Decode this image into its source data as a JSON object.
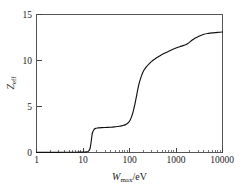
{
  "chart_data": {
    "type": "line",
    "title": "",
    "subtitle": "",
    "xlabel": "W_max/eV",
    "xlabel_parts": {
      "symbol": "W",
      "subscript": "max",
      "unit": "/eV"
    },
    "ylabel": "Z_eff",
    "ylabel_parts": {
      "symbol": "Z",
      "subscript": "eff"
    },
    "xscale": "log",
    "yscale": "linear",
    "xlim": [
      1,
      10000
    ],
    "ylim": [
      0,
      15
    ],
    "grid": false,
    "legend": false,
    "legend_position": "none",
    "xticks": [
      1,
      10,
      100,
      1000,
      10000
    ],
    "xtick_labels": [
      "1",
      "10",
      "100",
      "1000",
      "10000"
    ],
    "yticks": [
      0,
      5,
      10,
      15
    ],
    "ytick_labels": [
      "0",
      "5",
      "10",
      "15"
    ],
    "minor_ticks": "log decades 2-9",
    "curve_color": "#111111",
    "series": [
      {
        "name": "Z_eff",
        "x": [
          1,
          2,
          3,
          5,
          7,
          9,
          11,
          12,
          13,
          14,
          14.5,
          15,
          15.5,
          16,
          17,
          18,
          19,
          20,
          22,
          25,
          30,
          40,
          50,
          60,
          70,
          80,
          90,
          100,
          110,
          120,
          130,
          140,
          150,
          160,
          180,
          200,
          230,
          260,
          300,
          350,
          400,
          500,
          600,
          700,
          800,
          1000,
          1200,
          1500,
          1800,
          2200,
          2600,
          3000,
          4000,
          5000,
          6000,
          8000,
          10000
        ],
        "y": [
          0.02,
          0.02,
          0.02,
          0.03,
          0.03,
          0.04,
          0.05,
          0.07,
          0.12,
          0.35,
          0.7,
          1.2,
          1.75,
          2.15,
          2.45,
          2.58,
          2.63,
          2.66,
          2.68,
          2.7,
          2.72,
          2.75,
          2.8,
          2.85,
          2.92,
          3.0,
          3.15,
          3.4,
          3.85,
          4.45,
          5.2,
          6.0,
          6.8,
          7.45,
          8.3,
          8.85,
          9.3,
          9.6,
          9.9,
          10.15,
          10.35,
          10.65,
          10.85,
          11.0,
          11.15,
          11.35,
          11.5,
          11.65,
          11.85,
          12.2,
          12.45,
          12.6,
          12.85,
          12.95,
          13.0,
          13.05,
          13.1
        ]
      }
    ],
    "annotations": [
      {
        "text": "first plateau near Z_eff = 2.7 for W_max between 20 and 90 eV"
      },
      {
        "text": "second plateau near Z_eff = 13.1 approaching W_max = 10000 eV"
      }
    ]
  }
}
